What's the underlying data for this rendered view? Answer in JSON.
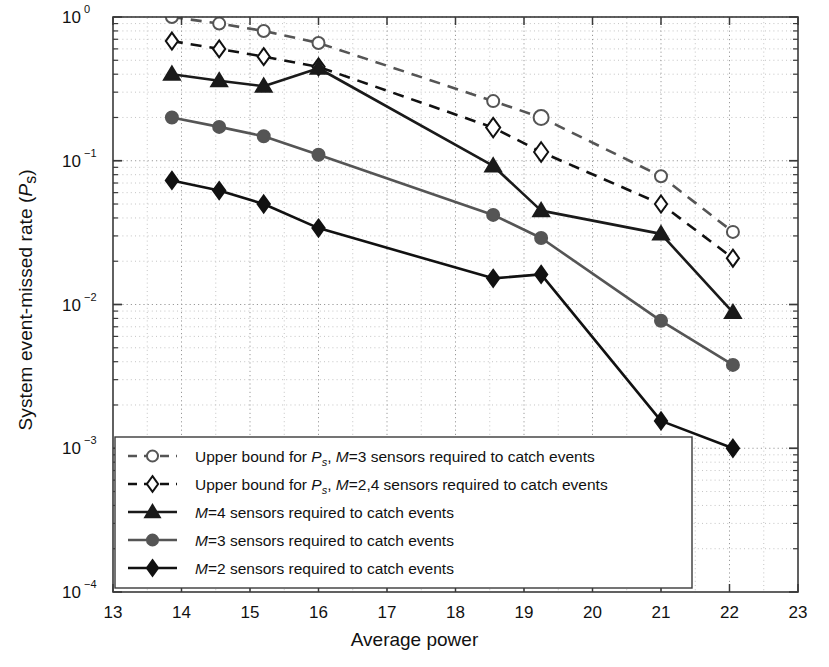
{
  "figure": {
    "xlabel": "Average power",
    "ylabel": "System event-missed rate (Ps)",
    "ylabel_main": "System event-missed rate (",
    "ylabel_italic": "P",
    "ylabel_sub": "s",
    "ylabel_close": ")"
  },
  "axes": {
    "x_ticks": [
      "13",
      "14",
      "15",
      "16",
      "17",
      "18",
      "19",
      "20",
      "21",
      "22",
      "23"
    ],
    "y_ticks": [
      "10^0",
      "10^-1",
      "10^-2",
      "10^-3",
      "10^-4"
    ],
    "y_tick_base": "10",
    "y_tick_exps": [
      "0",
      "-1",
      "-2",
      "-3",
      "-4"
    ],
    "xlim": [
      13,
      23
    ],
    "ylim": [
      0.0001,
      1
    ]
  },
  "legend": {
    "items": [
      {
        "label_pre": "Upper bound for ",
        "italic1": "P",
        "sub1": "s",
        "mid": ", ",
        "italic2": "M",
        "rest": "=3 sensors required to catch events",
        "full": "Upper bound for Ps, M=3 sensors required to catch events",
        "marker": "circle",
        "style": "dashed",
        "color": "#555555"
      },
      {
        "label_pre": "Upper bound for ",
        "italic1": "P",
        "sub1": "s",
        "mid": ", ",
        "italic2": "M",
        "rest": "=2,4 sensors required to catch events",
        "full": "Upper bound for Ps, M=2,4 sensors required to catch events",
        "marker": "diamond",
        "style": "dashed",
        "color": "#111111"
      },
      {
        "label_pre": "",
        "italic1": "",
        "sub1": "",
        "mid": "",
        "italic2": "M",
        "rest": "=4 sensors required to catch events",
        "full": "M=4 sensors required to catch events",
        "marker": "triangle",
        "style": "solid",
        "color": "#1a1a1a"
      },
      {
        "label_pre": "",
        "italic1": "",
        "sub1": "",
        "mid": "",
        "italic2": "M",
        "rest": "=3 sensors required to catch events",
        "full": "M=3 sensors required to catch events",
        "marker": "circle",
        "style": "solid",
        "color": "#555555"
      },
      {
        "label_pre": "",
        "italic1": "",
        "sub1": "",
        "mid": "",
        "italic2": "M",
        "rest": "=2 sensors required to catch events",
        "full": "M=2 sensors required to catch events",
        "marker": "diamond",
        "style": "solid",
        "color": "#111111"
      }
    ]
  },
  "chart_data": {
    "type": "line",
    "title": "",
    "xlabel": "Average power",
    "ylabel": "System event-missed rate (Ps)",
    "xlim": [
      13,
      23
    ],
    "ylim": [
      0.0001,
      1
    ],
    "yscale": "log",
    "xscale": "linear",
    "grid": true,
    "grid_style": "dotted-minor-and-major",
    "legend_position": "lower-left-inside",
    "series": [
      {
        "name": "Upper bound for Ps, M=3 sensors required to catch events",
        "marker": "circle",
        "linestyle": "dashed",
        "color": "#555555",
        "x": [
          13.86,
          14.55,
          15.2,
          16.0,
          18.55,
          19.25,
          21.0,
          22.05
        ],
        "y": [
          1.0,
          0.9,
          0.8,
          0.66,
          0.26,
          0.2,
          0.078,
          0.032
        ]
      },
      {
        "name": "Upper bound for Ps, M=2,4 sensors required to catch events",
        "marker": "diamond",
        "linestyle": "dashed",
        "color": "#111111",
        "x": [
          13.86,
          14.55,
          15.2,
          16.0,
          18.55,
          19.25,
          21.0,
          22.05
        ],
        "y": [
          0.68,
          0.6,
          0.53,
          0.45,
          0.17,
          0.115,
          0.05,
          0.021
        ]
      },
      {
        "name": "M=4 sensors required to catch events",
        "marker": "triangle",
        "linestyle": "solid",
        "color": "#1a1a1a",
        "x": [
          13.86,
          14.55,
          15.2,
          16.0,
          18.55,
          19.25,
          21.0,
          22.05
        ],
        "y": [
          0.4,
          0.36,
          0.33,
          0.44,
          0.092,
          0.045,
          0.031,
          0.0088
        ]
      },
      {
        "name": "M=3 sensors required to catch events",
        "marker": "circle",
        "linestyle": "solid",
        "color": "#555555",
        "x": [
          13.86,
          14.55,
          15.2,
          16.0,
          18.55,
          19.25,
          21.0,
          22.05
        ],
        "y": [
          0.2,
          0.172,
          0.148,
          0.11,
          0.042,
          0.029,
          0.0077,
          0.0038
        ]
      },
      {
        "name": "M=2 sensors required to catch events",
        "marker": "diamond",
        "linestyle": "solid",
        "color": "#111111",
        "x": [
          13.86,
          14.55,
          15.2,
          16.0,
          18.55,
          19.25,
          21.0,
          22.05
        ],
        "y": [
          0.073,
          0.062,
          0.05,
          0.034,
          0.0152,
          0.0162,
          0.00155,
          0.001
        ]
      }
    ]
  }
}
